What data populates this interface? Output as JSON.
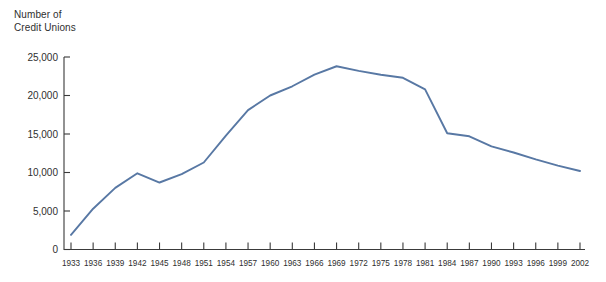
{
  "figure": {
    "axis_title": "Number of\nCredit Unions",
    "background_color": "#ffffff",
    "axis_color": "#3a3a3a",
    "text_color": "#2f2f2f"
  },
  "chart_data": {
    "type": "line",
    "title": "Number of Credit Unions",
    "xlabel": "",
    "ylabel": "Number of Credit Unions",
    "xlim": [
      1933,
      2002
    ],
    "ylim": [
      0,
      25000
    ],
    "grid": false,
    "legend": "none",
    "series_color": "#5878a4",
    "ytick_labels": [
      "0",
      "5,000",
      "10,000",
      "15,000",
      "20,000",
      "25,000"
    ],
    "ytick_values": [
      0,
      5000,
      10000,
      15000,
      20000,
      25000
    ],
    "xtick_labels": [
      "1933",
      "1936",
      "1939",
      "1942",
      "1945",
      "1948",
      "1951",
      "1954",
      "1957",
      "1960",
      "1963",
      "1966",
      "1969",
      "1972",
      "1975",
      "1978",
      "1981",
      "1984",
      "1987",
      "1990",
      "1993",
      "1996",
      "1999",
      "2002"
    ],
    "x": [
      1933,
      1936,
      1939,
      1942,
      1945,
      1948,
      1951,
      1954,
      1957,
      1960,
      1963,
      1966,
      1969,
      1972,
      1975,
      1978,
      1981,
      1984,
      1987,
      1990,
      1993,
      1996,
      1999,
      2002
    ],
    "values": [
      1900,
      5300,
      8000,
      9900,
      8700,
      9800,
      11300,
      14800,
      18100,
      20000,
      21200,
      22700,
      23800,
      23200,
      22700,
      22300,
      20800,
      15100,
      14700,
      13400,
      12600,
      11700,
      10900,
      10200
    ],
    "series": [
      {
        "name": "Number of Credit Unions",
        "color": "#5878a4",
        "values": [
          1900,
          5300,
          8000,
          9900,
          8700,
          9800,
          11300,
          14800,
          18100,
          20000,
          21200,
          22700,
          23800,
          23200,
          22700,
          22300,
          20800,
          15100,
          14700,
          13400,
          12600,
          11700,
          10900,
          10200
        ]
      }
    ]
  }
}
